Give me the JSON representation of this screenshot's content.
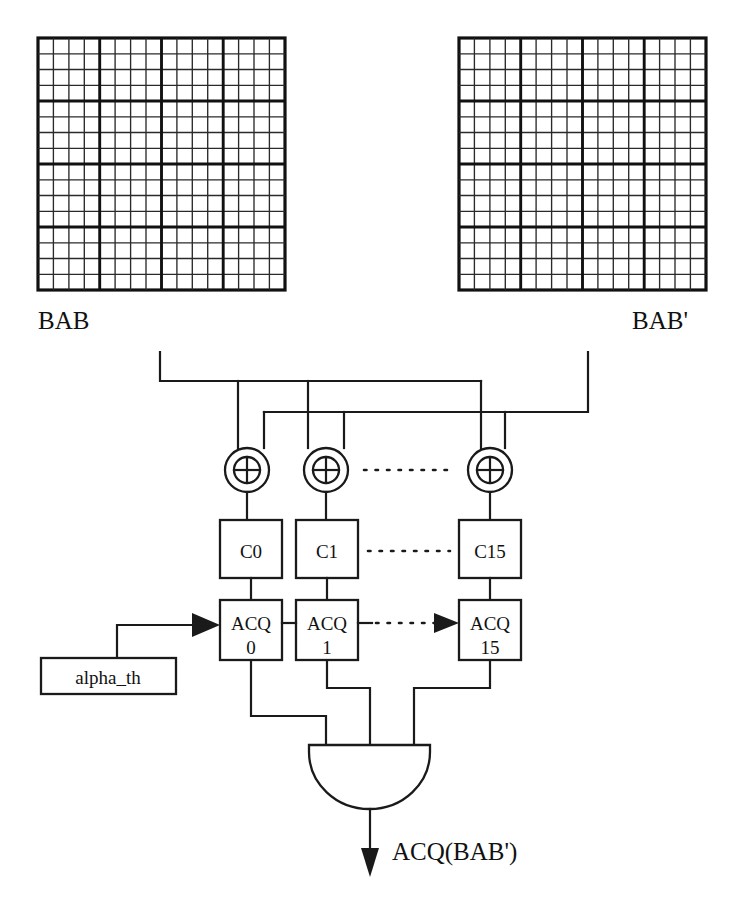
{
  "figure": {
    "background_color": "#ffffff",
    "line_color": "#1a1a1a"
  },
  "grids": [
    {
      "id": "bab-grid",
      "label": "BAB",
      "label_position": "below-left",
      "rows": 16,
      "cols": 16,
      "block_size": 4,
      "x": 38,
      "y": 38,
      "w": 247,
      "h": 252
    },
    {
      "id": "bab-prime-grid",
      "label": "BAB'",
      "label_position": "below-right",
      "rows": 16,
      "cols": 16,
      "block_size": 4,
      "x": 459,
      "y": 38,
      "w": 247,
      "h": 252
    }
  ],
  "xor_gates": [
    {
      "id": "xor-0",
      "symbol": "⊕",
      "cx": 247,
      "cy": 470
    },
    {
      "id": "xor-1",
      "symbol": "⊕",
      "cx": 326,
      "cy": 470
    },
    {
      "id": "xor-15",
      "symbol": "⊕",
      "cx": 490,
      "cy": 470
    }
  ],
  "c_boxes": [
    {
      "id": "c-0",
      "label": "C0",
      "x": 220,
      "y": 520,
      "w": 62,
      "h": 58
    },
    {
      "id": "c-1",
      "label": "C1",
      "x": 296,
      "y": 520,
      "w": 62,
      "h": 58
    },
    {
      "id": "c-15",
      "label": "C15",
      "x": 459,
      "y": 520,
      "w": 62,
      "h": 58
    }
  ],
  "acq_boxes": [
    {
      "id": "acq-0",
      "label": "ACQ",
      "index": "0",
      "x": 220,
      "y": 600,
      "w": 62,
      "h": 60
    },
    {
      "id": "acq-1",
      "label": "ACQ",
      "index": "1",
      "x": 296,
      "y": 600,
      "w": 62,
      "h": 60
    },
    {
      "id": "acq-15",
      "label": "ACQ",
      "index": "15",
      "x": 459,
      "y": 600,
      "w": 62,
      "h": 60
    }
  ],
  "threshold_box": {
    "id": "alpha-th",
    "label": "alpha_th",
    "x": 41,
    "y": 658,
    "w": 135,
    "h": 36
  },
  "and_gate": {
    "id": "and-gate",
    "shape": "semicircle-d",
    "x": 309,
    "y": 745,
    "w": 121,
    "h": 64,
    "inputs": 3
  },
  "output": {
    "id": "acq-output",
    "label": "ACQ(BAB')",
    "arrow_x": 370,
    "arrow_y_start": 810,
    "arrow_y_end": 872,
    "label_x": 392,
    "label_y": 858
  },
  "ellipses": [
    {
      "id": "ellipsis-xor",
      "between": [
        "xor-1",
        "xor-15"
      ],
      "x1": 362,
      "x2": 456,
      "y": 470
    },
    {
      "id": "ellipsis-c",
      "between": [
        "c-1",
        "c-15"
      ],
      "x1": 366,
      "x2": 452,
      "y": 551
    },
    {
      "id": "ellipsis-acq",
      "between": [
        "acq-1",
        "acq-15"
      ],
      "x1": 366,
      "x2": 440,
      "y": 624
    }
  ],
  "buses": [
    {
      "id": "bab-bus",
      "source": "BAB",
      "rail_y": 381,
      "riser_x": 160,
      "riser_top_y": 352,
      "rail_x1": 160,
      "rail_x2": 481,
      "drop_x": [
        238,
        481
      ]
    },
    {
      "id": "bab-prime-bus",
      "source": "BAB'",
      "rail_y": 412,
      "riser_x": 588,
      "riser_top_y": 352,
      "rail_x1": 264,
      "rail_x2": 588,
      "drop_x": [
        264,
        308,
        505
      ]
    }
  ]
}
